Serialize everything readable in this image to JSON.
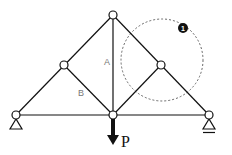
{
  "diagram": {
    "type": "truss",
    "nodes": [
      {
        "id": "left_support",
        "x": 16,
        "y": 115
      },
      {
        "id": "left_mid",
        "x": 64,
        "y": 65
      },
      {
        "id": "top",
        "x": 113,
        "y": 15
      },
      {
        "id": "right_mid",
        "x": 161,
        "y": 65
      },
      {
        "id": "right_support",
        "x": 209,
        "y": 115
      },
      {
        "id": "bottom_center",
        "x": 113,
        "y": 115
      }
    ],
    "members": [
      {
        "from": "left_support",
        "to": "left_mid"
      },
      {
        "from": "left_mid",
        "to": "top"
      },
      {
        "from": "top",
        "to": "right_mid"
      },
      {
        "from": "right_mid",
        "to": "right_support"
      },
      {
        "from": "left_support",
        "to": "bottom_center"
      },
      {
        "from": "bottom_center",
        "to": "right_support"
      },
      {
        "from": "top",
        "to": "bottom_center",
        "label": "A"
      },
      {
        "from": "left_mid",
        "to": "bottom_center",
        "label": "B"
      },
      {
        "from": "right_mid",
        "to": "bottom_center"
      }
    ],
    "labels": {
      "member_a": "A",
      "member_b": "B",
      "load": "P",
      "detail_badge": "1"
    },
    "supports": {
      "left": "pin",
      "right": "roller"
    },
    "detail_circle": {
      "cx": 162,
      "cy": 60,
      "r": 41
    }
  }
}
